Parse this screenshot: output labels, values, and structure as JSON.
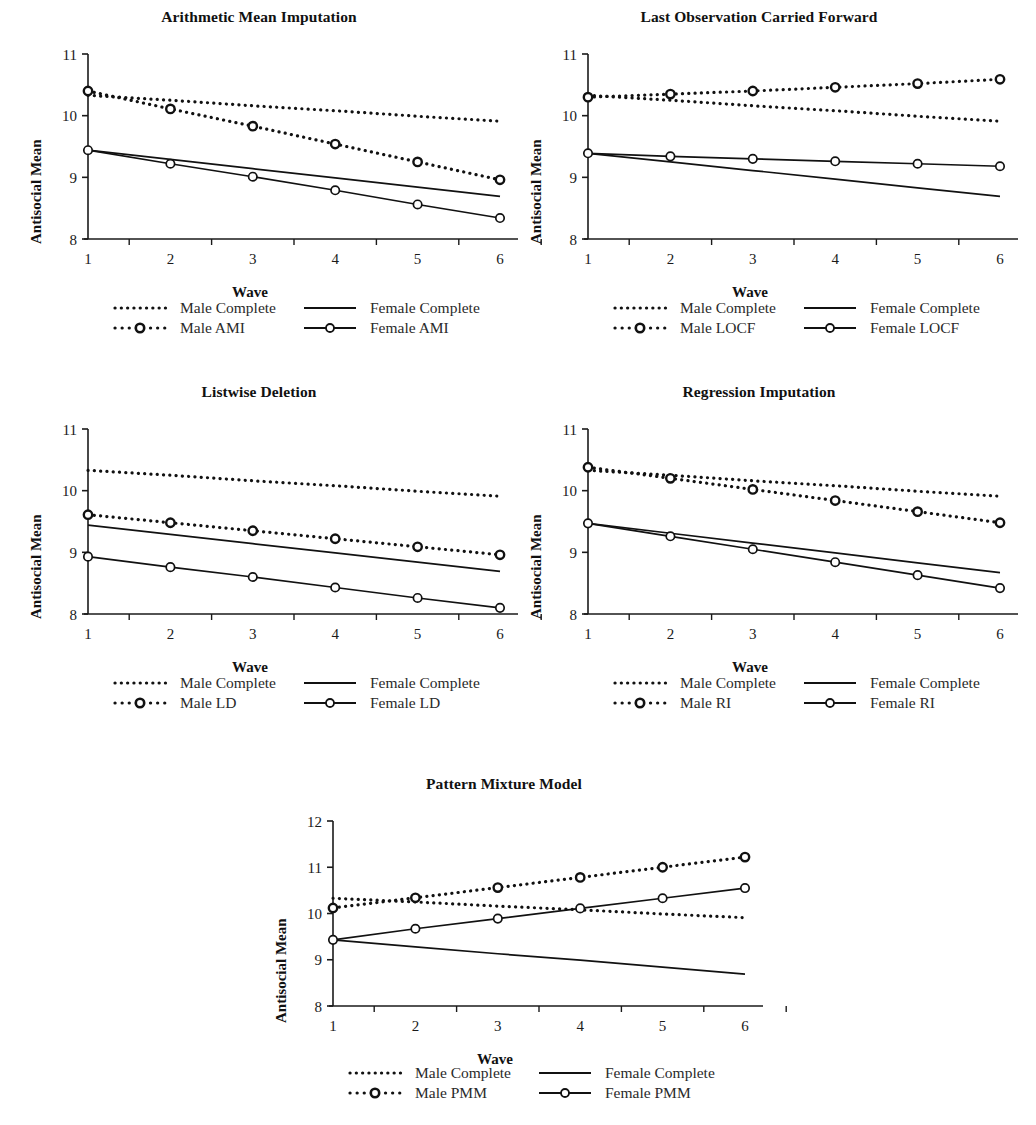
{
  "figure": {
    "ylabel": "Antisocial Mean",
    "xlabel": "Wave",
    "caption": ""
  },
  "panels": [
    {
      "id": "ami",
      "title": "Arithmetic Mean Imputation",
      "legend": [
        {
          "key": "dotted",
          "label": "Male Complete"
        },
        {
          "key": "solid",
          "label": "Female Complete"
        },
        {
          "key": "dotted-marker",
          "label": "Male AMI"
        },
        {
          "key": "solid-marker",
          "label": "Female AMI"
        }
      ]
    },
    {
      "id": "locf",
      "title": "Last Observation Carried Forward",
      "legend": [
        {
          "key": "dotted",
          "label": "Male Complete"
        },
        {
          "key": "solid",
          "label": "Female Complete"
        },
        {
          "key": "dotted-marker",
          "label": "Male LOCF"
        },
        {
          "key": "solid-marker",
          "label": "Female LOCF"
        }
      ]
    },
    {
      "id": "ld",
      "title": "Listwise Deletion",
      "legend": [
        {
          "key": "dotted",
          "label": "Male Complete"
        },
        {
          "key": "solid",
          "label": "Female Complete"
        },
        {
          "key": "dotted-marker",
          "label": "Male LD"
        },
        {
          "key": "solid-marker",
          "label": "Female LD"
        }
      ]
    },
    {
      "id": "ri",
      "title": "Regression Imputation",
      "legend": [
        {
          "key": "dotted",
          "label": "Male Complete"
        },
        {
          "key": "solid",
          "label": "Female Complete"
        },
        {
          "key": "dotted-marker",
          "label": "Male RI"
        },
        {
          "key": "solid-marker",
          "label": "Female RI"
        }
      ]
    },
    {
      "id": "pmm",
      "title": "Pattern Mixture Model",
      "legend": [
        {
          "key": "dotted",
          "label": "Male Complete"
        },
        {
          "key": "solid",
          "label": "Female Complete"
        },
        {
          "key": "dotted-marker",
          "label": "Male PMM"
        },
        {
          "key": "solid-marker",
          "label": "Female PMM"
        }
      ]
    }
  ],
  "chart_data": [
    {
      "id": "ami",
      "type": "line",
      "title": "Arithmetic Mean Imputation",
      "xlabel": "Wave",
      "ylabel": "Antisocial Mean",
      "categories": [
        1,
        2,
        3,
        4,
        5,
        6
      ],
      "x": [
        1,
        2,
        3,
        4,
        5,
        6
      ],
      "xlim": [
        1,
        6
      ],
      "ylim": [
        8,
        11
      ],
      "yticks": [
        8,
        9,
        10,
        11
      ],
      "xticks": [
        1,
        2,
        3,
        4,
        5,
        6
      ],
      "grid": false,
      "legend_position": "below",
      "series": [
        {
          "name": "Male Complete",
          "style": "dotted",
          "marker": "none",
          "values": [
            10.33,
            10.25,
            10.16,
            10.08,
            9.99,
            9.91
          ]
        },
        {
          "name": "Female Complete",
          "style": "solid",
          "marker": "none",
          "values": [
            9.44,
            9.29,
            9.14,
            8.99,
            8.84,
            8.69
          ]
        },
        {
          "name": "Male AMI",
          "style": "dotted",
          "marker": "circle",
          "values": [
            10.4,
            10.11,
            9.83,
            9.54,
            9.25,
            8.96
          ]
        },
        {
          "name": "Female AMI",
          "style": "solid",
          "marker": "circle",
          "values": [
            9.44,
            9.22,
            9.01,
            8.79,
            8.56,
            8.34
          ]
        }
      ]
    },
    {
      "id": "locf",
      "type": "line",
      "title": "Last Observation Carried Forward",
      "xlabel": "Wave",
      "ylabel": "Antisocial Mean",
      "categories": [
        1,
        2,
        3,
        4,
        5,
        6
      ],
      "x": [
        1,
        2,
        3,
        4,
        5,
        6
      ],
      "xlim": [
        1,
        6
      ],
      "ylim": [
        8,
        11
      ],
      "yticks": [
        8,
        9,
        10,
        11
      ],
      "xticks": [
        1,
        2,
        3,
        4,
        5,
        6
      ],
      "grid": false,
      "legend_position": "below",
      "series": [
        {
          "name": "Male Complete",
          "style": "dotted",
          "marker": "none",
          "values": [
            10.33,
            10.25,
            10.16,
            10.08,
            9.99,
            9.91
          ]
        },
        {
          "name": "Female Complete",
          "style": "solid",
          "marker": "none",
          "values": [
            9.39,
            9.25,
            9.11,
            8.97,
            8.83,
            8.69
          ]
        },
        {
          "name": "Male LOCF",
          "style": "dotted",
          "marker": "circle",
          "values": [
            10.3,
            10.35,
            10.4,
            10.46,
            10.52,
            10.59
          ]
        },
        {
          "name": "Female LOCF",
          "style": "solid",
          "marker": "circle",
          "values": [
            9.39,
            9.34,
            9.3,
            9.26,
            9.22,
            9.18
          ]
        }
      ]
    },
    {
      "id": "ld",
      "type": "line",
      "title": "Listwise Deletion",
      "xlabel": "Wave",
      "ylabel": "Antisocial Mean",
      "categories": [
        1,
        2,
        3,
        4,
        5,
        6
      ],
      "x": [
        1,
        2,
        3,
        4,
        5,
        6
      ],
      "xlim": [
        1,
        6
      ],
      "ylim": [
        8,
        11
      ],
      "yticks": [
        8,
        9,
        10,
        11
      ],
      "xticks": [
        1,
        2,
        3,
        4,
        5,
        6
      ],
      "grid": false,
      "legend_position": "below",
      "series": [
        {
          "name": "Male Complete",
          "style": "dotted",
          "marker": "none",
          "values": [
            10.33,
            10.25,
            10.16,
            10.08,
            9.99,
            9.91
          ]
        },
        {
          "name": "Female Complete",
          "style": "solid",
          "marker": "none",
          "values": [
            9.44,
            9.29,
            9.14,
            8.99,
            8.84,
            8.69
          ]
        },
        {
          "name": "Male LD",
          "style": "dotted",
          "marker": "circle",
          "values": [
            9.61,
            9.48,
            9.35,
            9.22,
            9.09,
            8.96
          ]
        },
        {
          "name": "Female LD",
          "style": "solid",
          "marker": "circle",
          "values": [
            8.93,
            8.76,
            8.6,
            8.43,
            8.26,
            8.1
          ]
        }
      ]
    },
    {
      "id": "ri",
      "type": "line",
      "title": "Regression Imputation",
      "xlabel": "Wave",
      "ylabel": "Antisocial Mean",
      "categories": [
        1,
        2,
        3,
        4,
        5,
        6
      ],
      "x": [
        1,
        2,
        3,
        4,
        5,
        6
      ],
      "xlim": [
        1,
        6
      ],
      "ylim": [
        8,
        11
      ],
      "yticks": [
        8,
        9,
        10,
        11
      ],
      "xticks": [
        1,
        2,
        3,
        4,
        5,
        6
      ],
      "grid": false,
      "legend_position": "below",
      "series": [
        {
          "name": "Male Complete",
          "style": "dotted",
          "marker": "none",
          "values": [
            10.33,
            10.25,
            10.16,
            10.08,
            9.99,
            9.91
          ]
        },
        {
          "name": "Female Complete",
          "style": "solid",
          "marker": "none",
          "values": [
            9.47,
            9.31,
            9.15,
            8.99,
            8.83,
            8.67
          ]
        },
        {
          "name": "Male RI",
          "style": "dotted",
          "marker": "circle",
          "values": [
            10.38,
            10.2,
            10.02,
            9.84,
            9.66,
            9.48
          ]
        },
        {
          "name": "Female RI",
          "style": "solid",
          "marker": "circle",
          "values": [
            9.47,
            9.26,
            9.05,
            8.84,
            8.63,
            8.42
          ]
        }
      ]
    },
    {
      "id": "pmm",
      "type": "line",
      "title": "Pattern Mixture Model",
      "xlabel": "Wave",
      "ylabel": "Antisocial Mean",
      "categories": [
        1,
        2,
        3,
        4,
        5,
        6
      ],
      "x": [
        1,
        2,
        3,
        4,
        5,
        6
      ],
      "xlim": [
        1,
        6
      ],
      "ylim": [
        8,
        12
      ],
      "yticks": [
        8,
        9,
        10,
        11,
        12
      ],
      "xticks": [
        1,
        2,
        3,
        4,
        5,
        6
      ],
      "grid": false,
      "legend_position": "below",
      "series": [
        {
          "name": "Male Complete",
          "style": "dotted",
          "marker": "none",
          "values": [
            10.33,
            10.25,
            10.16,
            10.08,
            9.99,
            9.91
          ]
        },
        {
          "name": "Female Complete",
          "style": "solid",
          "marker": "none",
          "values": [
            9.43,
            9.28,
            9.13,
            8.99,
            8.84,
            8.69
          ]
        },
        {
          "name": "Male PMM",
          "style": "dotted",
          "marker": "circle",
          "values": [
            10.12,
            10.34,
            10.56,
            10.78,
            11.0,
            11.22
          ]
        },
        {
          "name": "Female PMM",
          "style": "solid",
          "marker": "circle",
          "values": [
            9.43,
            9.67,
            9.89,
            10.11,
            10.33,
            10.55
          ]
        }
      ]
    }
  ]
}
